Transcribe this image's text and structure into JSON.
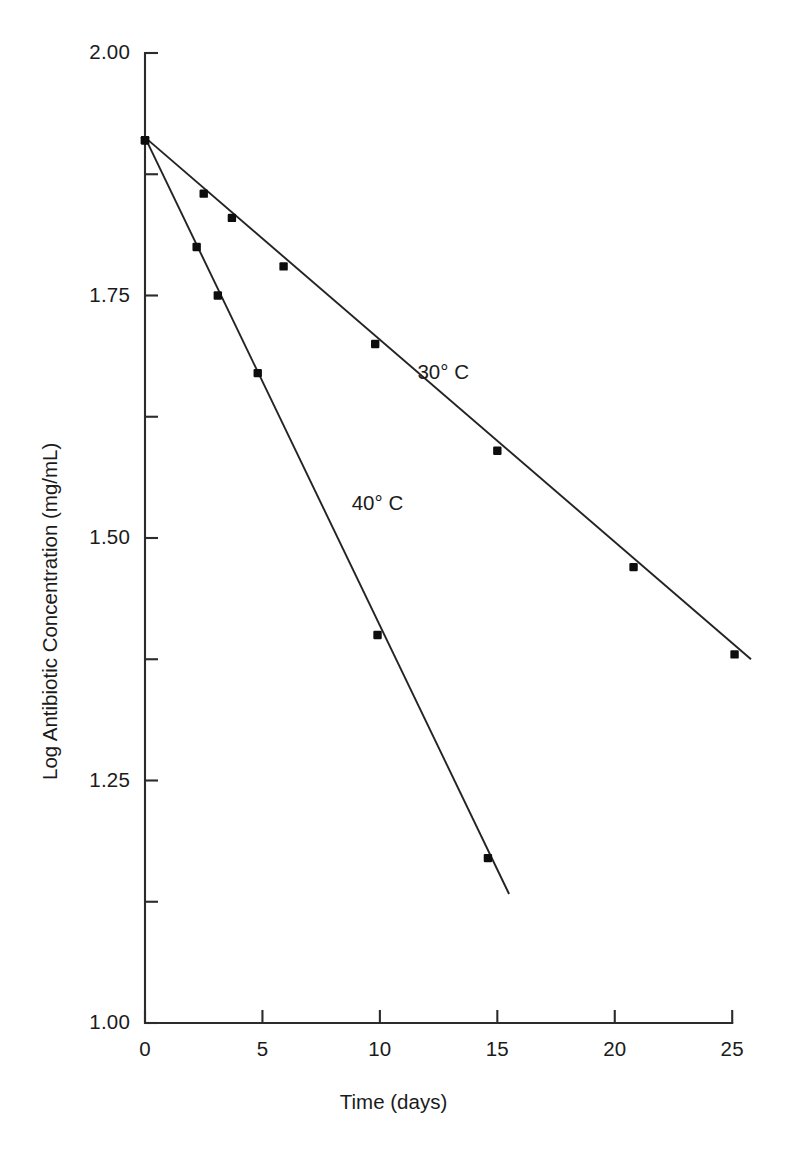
{
  "chart_data": {
    "type": "line",
    "title": "",
    "xlabel": "Time (days)",
    "ylabel": "Log Antibiotic Concentration (mg/mL)",
    "xlim": [
      0,
      25.8
    ],
    "ylim": [
      1.0,
      2.0
    ],
    "grid": false,
    "legend_position": "inline-annotation",
    "x_ticks": [
      0,
      5,
      10,
      15,
      20,
      25
    ],
    "x_tick_labels": [
      "0",
      "5",
      "10",
      "15",
      "20",
      "25"
    ],
    "y_ticks": [
      1.0,
      1.25,
      1.5,
      1.75,
      2.0
    ],
    "y_tick_labels": [
      "1.00",
      "1.25",
      "1.50",
      "1.75",
      "2.00"
    ],
    "y_minor_ticks": [
      1.125,
      1.375,
      1.625,
      1.875
    ],
    "series": [
      {
        "name": "30° C",
        "label_x": 11.6,
        "label_y": 1.67,
        "marker": "square",
        "x": [
          0,
          2.5,
          3.7,
          5.9,
          9.8,
          15.0,
          20.8,
          25.1
        ],
        "y": [
          1.91,
          1.855,
          1.83,
          1.78,
          1.7,
          1.59,
          1.47,
          1.38
        ],
        "fit_x": [
          0,
          25.8
        ],
        "fit_y": [
          1.913,
          1.375
        ]
      },
      {
        "name": "40° C",
        "label_x": 8.8,
        "label_y": 1.535,
        "marker": "square",
        "x": [
          0,
          2.2,
          3.1,
          4.8,
          9.9,
          14.6
        ],
        "y": [
          1.91,
          1.8,
          1.75,
          1.67,
          1.4,
          1.17
        ],
        "fit_x": [
          0,
          15.5
        ],
        "fit_y": [
          1.913,
          1.133
        ]
      }
    ]
  },
  "axes": {
    "x_title": "Time (days)",
    "y_title": "Log Antibiotic Concentration (mg/mL)"
  },
  "annotations": [
    {
      "text": "30° C"
    },
    {
      "text": "40° C"
    }
  ],
  "colors": {
    "line": "#232323",
    "axis": "#2b2b2b",
    "marker": "#0d0d0d",
    "background": "#ffffff"
  }
}
